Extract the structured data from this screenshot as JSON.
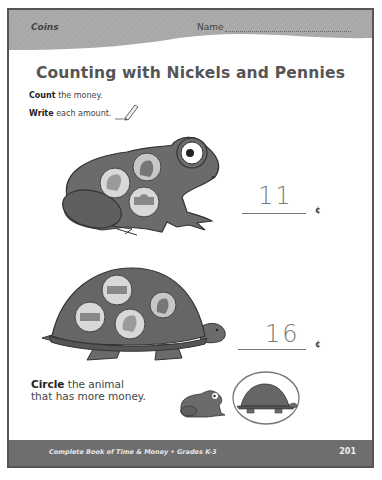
{
  "header": {
    "section": "Coins",
    "name_label": "Name"
  },
  "title": "Counting with Nickels and Pennies",
  "instructions": [
    {
      "bold": "Count",
      "rest": " the money."
    },
    {
      "bold": "Write",
      "rest": " each amount."
    }
  ],
  "problems": [
    {
      "animal": "frog",
      "coins": [
        "nickel-front",
        "penny-front",
        "nickel-back"
      ],
      "answer": "11",
      "unit": "¢"
    },
    {
      "animal": "turtle",
      "coins": [
        "nickel-back",
        "nickel-back",
        "nickel-front",
        "penny-front"
      ],
      "answer": "16",
      "unit": "¢"
    }
  ],
  "compare": {
    "bold": "Circle",
    "line1_rest": " the animal",
    "line2": "that has more money.",
    "choices": [
      "frog",
      "turtle"
    ],
    "circled": "turtle"
  },
  "footer": {
    "book_title": "Complete Book of Time & Money • Grades K-3",
    "page_number": "201"
  },
  "colors": {
    "header_band": "#a9a9a9",
    "footer_band": "#6e6e6e",
    "animal_body": "#6b6b6b",
    "coin": "#d8d8d8"
  }
}
